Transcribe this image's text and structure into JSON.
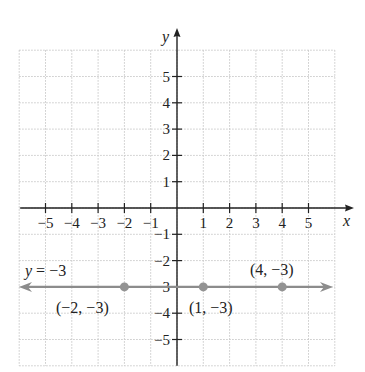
{
  "chart_data": {
    "type": "line",
    "title": "",
    "xlabel": "x",
    "ylabel": "y",
    "xlim": [
      -6,
      6
    ],
    "ylim": [
      -6,
      6
    ],
    "grid": true,
    "x_ticks": [
      -5,
      -4,
      -3,
      -2,
      -1,
      1,
      2,
      3,
      4,
      5
    ],
    "x_tick_labels": [
      "−5",
      "−4",
      "−3",
      "−2",
      "−1",
      "1",
      "2",
      "3",
      "4",
      "5"
    ],
    "y_ticks": [
      5,
      4,
      3,
      2,
      1,
      -1,
      -2,
      -3,
      -4,
      -5
    ],
    "y_tick_labels": [
      "5",
      "4",
      "3",
      "2",
      "1",
      "−1",
      "−2",
      "−3",
      "−4",
      "−5"
    ],
    "series": [
      {
        "name": "y = −3",
        "equation": "y = -3",
        "kind": "horizontal-line",
        "y": -3,
        "arrows": "both",
        "color": "#8c8c8c"
      }
    ],
    "points": [
      {
        "x": -2,
        "y": -3,
        "label": "(−2, −3)"
      },
      {
        "x": 1,
        "y": -3,
        "label": "(1, −3)"
      },
      {
        "x": 4,
        "y": -3,
        "label": "(4, −3)"
      }
    ],
    "annotations": [
      {
        "text": "y = −3",
        "near": "left end of line"
      }
    ]
  },
  "labels": {
    "x_axis": "x",
    "y_axis": "y",
    "equation": "y = −3",
    "point_a": "(−2, −3)",
    "point_b": "(1, −3)",
    "point_c": "(4, −3)"
  },
  "colors": {
    "line": "#8c8c8c",
    "point": "#939393",
    "axis": "#222222",
    "grid": "#c8c8c8"
  }
}
